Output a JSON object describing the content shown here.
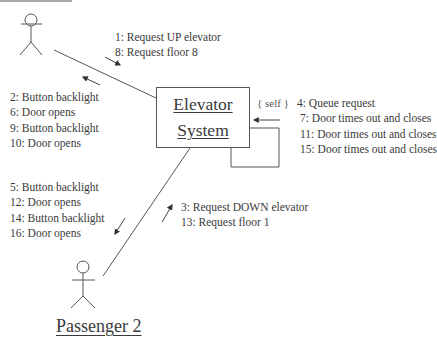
{
  "diagram": {
    "type": "UML communication diagram",
    "actors": [
      {
        "id": "passenger1",
        "label": "Passenger 1",
        "label_visible": "cropped"
      },
      {
        "id": "passenger2",
        "label": "Passenger 2"
      }
    ],
    "system": {
      "line1": "Elevator",
      "line2": "System"
    },
    "self_label": "{ self }",
    "messages": {
      "to_system_from_p1": [
        "1: Request UP elevator",
        "8: Request floor 8"
      ],
      "to_p1_from_system": [
        "2: Button backlight",
        "6: Door opens",
        "9: Button backlight",
        "10: Door opens"
      ],
      "self": [
        "4: Queue request",
        "7: Door times out and closes",
        "11: Door times out and closes",
        "15: Door times out and closes"
      ],
      "to_p2_from_system": [
        "5: Button backlight",
        "12: Door opens",
        "14: Button backlight",
        "16: Door opens"
      ],
      "to_system_from_p2": [
        "3: Request DOWN elevator",
        "13: Request floor 1"
      ]
    },
    "colors": {
      "line": "#555555",
      "text": "#3a3a3a",
      "background": "#ffffff"
    }
  }
}
